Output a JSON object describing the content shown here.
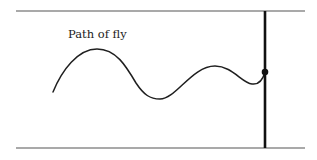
{
  "diagram": {
    "label": "Path of fly",
    "colors": {
      "line": "#3a3a3a",
      "curve": "#1f1f1f",
      "wall": "#111111",
      "dot": "#111111",
      "background": "#ffffff"
    },
    "elements": {
      "top_boundary": {
        "x1": 16,
        "y1": 11,
        "x2": 305,
        "y2": 11
      },
      "bottom_boundary": {
        "x1": 16,
        "y1": 148,
        "x2": 305,
        "y2": 148
      },
      "vertical_wall": {
        "x1": 265,
        "y1": 11,
        "x2": 265,
        "y2": 148
      },
      "dot": {
        "cx": 265,
        "cy": 72,
        "r": 3.3
      }
    }
  }
}
